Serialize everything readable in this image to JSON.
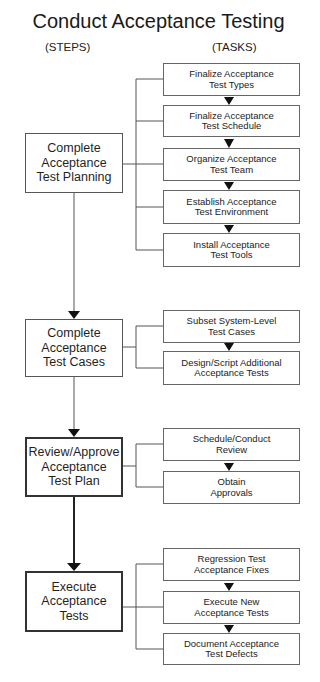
{
  "title": "Conduct Acceptance Testing",
  "columns": {
    "steps": "(STEPS)",
    "tasks": "(TASKS)"
  },
  "steps": [
    {
      "label": "Complete\nAcceptance\nTest Planning",
      "tasks": [
        "Finalize Acceptance\nTest Types",
        "Finalize Acceptance\nTest Schedule",
        "Organize Acceptance\nTest Team",
        "Establish Acceptance\nTest Environment",
        "Install Acceptance\nTest Tools"
      ]
    },
    {
      "label": "Complete\nAcceptance\nTest Cases",
      "tasks": [
        "Subset System-Level\nTest Cases",
        "Design/Script Additional\nAcceptance Tests"
      ]
    },
    {
      "label": "Review/Approve\nAcceptance\nTest Plan",
      "tasks": [
        "Schedule/Conduct\nReview",
        "Obtain\nApprovals"
      ]
    },
    {
      "label": "Execute\nAcceptance\nTests",
      "tasks": [
        "Regression Test\nAcceptance Fixes",
        "Execute New\nAcceptance Tests",
        "Document Acceptance\nTest Defects"
      ]
    }
  ],
  "colors": {
    "line": "#555555",
    "arrow": "#111111",
    "background": "#ffffff"
  }
}
